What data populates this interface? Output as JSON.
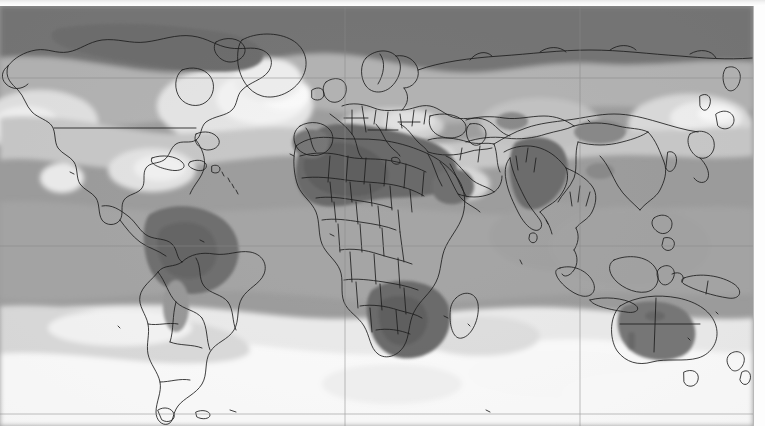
{
  "figure": {
    "kind": "world-map",
    "title": "",
    "projection": "equirectangular",
    "width_px": 765,
    "height_px": 443
  },
  "plate": {
    "left_px": 0,
    "top_px": 6,
    "width_px": 753,
    "height_px": 420,
    "frame_color": "#b8b8b8",
    "background_color": "#9e9e9e"
  },
  "graticule": {
    "visible": true,
    "color": "#8a8a8a",
    "horizontal_lines_y": [
      72,
      240,
      408
    ],
    "vertical_lines_x": [
      345,
      580
    ],
    "labels": []
  },
  "legend": {
    "visible": false,
    "entries": []
  },
  "palette": {
    "band_1_lightest": "#ffffff",
    "band_2": "#e6e6e6",
    "band_3": "#cfcfcf",
    "band_4": "#b4b4b4",
    "band_5_mid": "#9e9e9e",
    "band_6": "#8a8a8a",
    "band_7_dark": "#767676",
    "band_8_darkest": "#5f5f5f",
    "coastline": "#1d1d1d",
    "border": "#2b2b2b"
  },
  "chart_data": {
    "type": "heatmap",
    "title": "",
    "subtitle": "",
    "xlabel": "Longitude",
    "ylabel": "Latitude",
    "xlim": [
      -180,
      180
    ],
    "ylim": [
      -90,
      90
    ],
    "grid": true,
    "legend_position": "none",
    "colorbar_labels": [],
    "bands": [
      {
        "name": "band-1",
        "tone": "#ffffff",
        "rank": 1
      },
      {
        "name": "band-2",
        "tone": "#e6e6e6",
        "rank": 2
      },
      {
        "name": "band-3",
        "tone": "#cfcfcf",
        "rank": 3
      },
      {
        "name": "band-4",
        "tone": "#b4b4b4",
        "rank": 4
      },
      {
        "name": "band-5",
        "tone": "#9e9e9e",
        "rank": 5
      },
      {
        "name": "band-6",
        "tone": "#8a8a8a",
        "rank": 6
      },
      {
        "name": "band-7",
        "tone": "#767676",
        "rank": 7
      },
      {
        "name": "band-8",
        "tone": "#5f5f5f",
        "rank": 8
      }
    ],
    "annotations": [
      {
        "region": "Arctic / northern Canada / northern Siberia",
        "band": "band-7"
      },
      {
        "region": "Greenland interior",
        "band": "band-1"
      },
      {
        "region": "North Atlantic off Europe",
        "band": "band-2"
      },
      {
        "region": "Sahel / West Africa",
        "band": "band-8"
      },
      {
        "region": "Horn of Africa",
        "band": "band-7"
      },
      {
        "region": "Amazon basin",
        "band": "band-7"
      },
      {
        "region": "Indian subcontinent",
        "band": "band-7"
      },
      {
        "region": "Southern Africa",
        "band": "band-8"
      },
      {
        "region": "Interior Australia",
        "band": "band-7"
      },
      {
        "region": "Southern Ocean",
        "band": "band-1"
      },
      {
        "region": "Mediterranean / Turkey",
        "band": "band-3"
      },
      {
        "region": "North Pacific",
        "band": "band-2"
      }
    ]
  }
}
